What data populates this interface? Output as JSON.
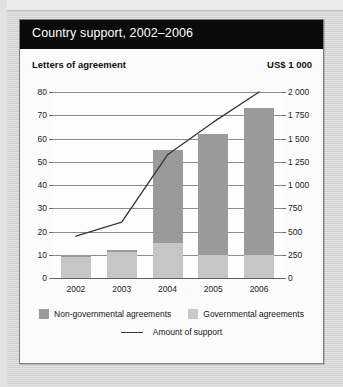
{
  "figure": {
    "title": "Country support, 2002–2006",
    "left_axis_caption": "Letters of agreement",
    "right_axis_caption": "US$ 1 000"
  },
  "legend": {
    "nongovernmental": "Non-governmental agreements",
    "governmental": "Governmental agreements",
    "line": "Amount of support"
  },
  "colors": {
    "title_bar": "#0b0b0b",
    "title_text": "#ffffff",
    "nongovernmental": "#9a9a9a",
    "governmental": "#c6c6c6",
    "line": "#3a3a3a",
    "gridline": "#8c8c8c",
    "card_background": "#fbfbfb",
    "page_background": "#d9d9d9"
  },
  "chart_data": {
    "type": "bar",
    "title": "Country support, 2002–2006",
    "xlabel": "",
    "ylabel": "Letters of agreement",
    "y2label": "US$ 1 000",
    "categories": [
      "2002",
      "2003",
      "2004",
      "2005",
      "2006"
    ],
    "ylim": [
      0,
      80
    ],
    "y2lim": [
      0,
      2000
    ],
    "yticks": [
      "0",
      "10",
      "20",
      "30",
      "40",
      "50",
      "60",
      "70",
      "80"
    ],
    "ytick_values": [
      0,
      10,
      20,
      30,
      40,
      50,
      60,
      70,
      80
    ],
    "y2ticks": [
      "0",
      "250",
      "500",
      "750",
      "1 000",
      "1 250",
      "1 500",
      "1 750",
      "2 000"
    ],
    "y2tick_values": [
      0,
      250,
      500,
      750,
      1000,
      1250,
      1500,
      1750,
      2000
    ],
    "grid": true,
    "stacked": true,
    "legend_position": "bottom",
    "series": [
      {
        "name": "Governmental agreements",
        "type": "bar",
        "stack": "agreements",
        "axis": "left",
        "color": "#c6c6c6",
        "values": [
          9,
          11,
          15,
          10,
          10
        ]
      },
      {
        "name": "Non-governmental agreements",
        "type": "bar",
        "stack": "agreements",
        "axis": "left",
        "color": "#9a9a9a",
        "values": [
          1,
          1,
          40,
          52,
          63
        ]
      },
      {
        "name": "Total agreements",
        "type": "bar-total",
        "axis": "left",
        "values": [
          10,
          12,
          55,
          62,
          73
        ]
      },
      {
        "name": "Amount of support",
        "type": "line",
        "axis": "right",
        "color": "#3a3a3a",
        "values": [
          450,
          600,
          1330,
          1680,
          2000
        ],
        "values_left_scale": [
          18,
          24,
          53,
          67,
          80
        ]
      }
    ]
  }
}
